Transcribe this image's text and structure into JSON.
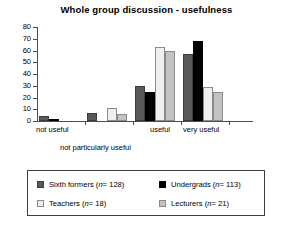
{
  "chart_data": {
    "type": "bar",
    "title": "Whole group discussion - usefulness",
    "xlabel": "",
    "ylabel": "",
    "ylim": [
      0,
      80
    ],
    "yticks": [
      0,
      10,
      20,
      30,
      40,
      50,
      60,
      70,
      80
    ],
    "grid": false,
    "legend_position": "bottom",
    "categories": [
      "not useful",
      "not particularly useful",
      "useful",
      "very useful"
    ],
    "series": [
      {
        "name": "Sixth formers (n=128)",
        "short": "Sixth formers",
        "n": 128,
        "color": "#595959",
        "values": [
          4,
          7,
          30,
          57
        ]
      },
      {
        "name": "Undergrads (n=113)",
        "short": "Undergrads",
        "n": 113,
        "color": "#000000",
        "values": [
          2,
          0,
          25,
          68
        ]
      },
      {
        "name": "Teachers (n=18)",
        "short": "Teachers",
        "n": 18,
        "color": "#efefef",
        "values": [
          0,
          11,
          63,
          29
        ]
      },
      {
        "name": "Lecturers (n=21)",
        "short": "Lecturers",
        "n": 21,
        "color": "#c2c2c2",
        "values": [
          0,
          6,
          60,
          25
        ]
      }
    ]
  },
  "title": {
    "text": "Whole group discussion - usefulness"
  },
  "axis": {
    "y_labels": [
      "80",
      "70",
      "60",
      "50",
      "40",
      "30",
      "20",
      "10",
      "0"
    ],
    "x_labels": {
      "not_useful": "not useful",
      "not_particularly_useful": "not particularly useful",
      "useful": "useful",
      "very_useful": "very useful"
    }
  },
  "legend": {
    "items": [
      {
        "label": "Sixth formers (",
        "var": "n",
        "eq": "= 128)"
      },
      {
        "label": "Undergrads (",
        "var": "n",
        "eq": "= 113)"
      },
      {
        "label": "Teachers (",
        "var": "n",
        "eq": "= 18)"
      },
      {
        "label": "Lecturers (",
        "var": "n",
        "eq": "= 21)"
      }
    ]
  }
}
